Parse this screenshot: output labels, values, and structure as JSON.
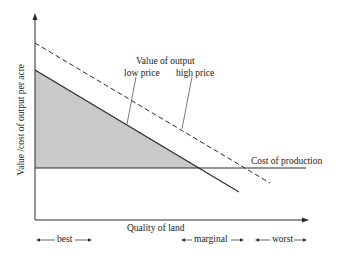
{
  "diagram": {
    "y_axis_label": "Value /cost of output per acre",
    "x_axis_label": "Quality of land",
    "curve_group_title": "Value of output",
    "low_price_label": "low price",
    "high_price_label": "high price",
    "cost_label": "Cost of production",
    "zones": [
      {
        "label": "best"
      },
      {
        "label": "marginal"
      },
      {
        "label": "worst"
      }
    ],
    "colors": {
      "line": "#2a2a2a",
      "shading": "#c9c9c9",
      "background": "#ffffff"
    }
  }
}
